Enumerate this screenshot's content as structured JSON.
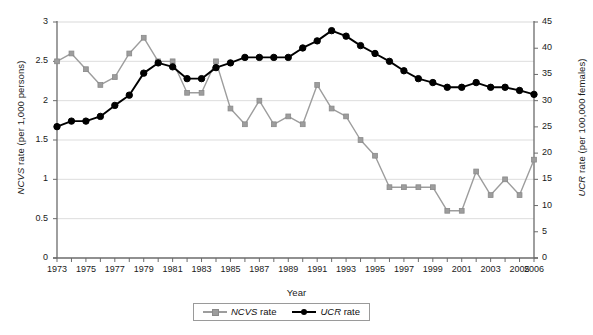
{
  "chart_data": {
    "type": "line",
    "title": "",
    "xlabel": "Year",
    "ylabel_left": "NCVS rate (per 1,000 persons)",
    "ylabel_left_italic_part": "NCVS",
    "ylabel_left_rest": " rate (per 1,000 persons)",
    "ylabel_right": "UCR rate (per 100,000 females)",
    "ylabel_right_italic_part": "UCR",
    "ylabel_right_rest": " rate (per 100,000 females)",
    "grid": true,
    "legend_position": "bottom",
    "ylim_left": [
      0,
      3
    ],
    "ylim_right": [
      0,
      45
    ],
    "yticks_left": [
      "0",
      "0.5",
      "1",
      "1.5",
      "2",
      "2.5",
      "3"
    ],
    "yticks_left_values": [
      0,
      0.5,
      1,
      1.5,
      2,
      2.5,
      3
    ],
    "yticks_right": [
      "0",
      "5",
      "10",
      "15",
      "20",
      "25",
      "30",
      "35",
      "40",
      "45"
    ],
    "yticks_right_values": [
      0,
      5,
      10,
      15,
      20,
      25,
      30,
      35,
      40,
      45
    ],
    "x": [
      1973,
      1974,
      1975,
      1976,
      1977,
      1978,
      1979,
      1980,
      1981,
      1982,
      1983,
      1984,
      1985,
      1986,
      1987,
      1988,
      1989,
      1990,
      1991,
      1992,
      1993,
      1994,
      1995,
      1996,
      1997,
      1998,
      1999,
      2000,
      2001,
      2002,
      2003,
      2004,
      2005,
      2006
    ],
    "xtick_labels": [
      "1973",
      "1975",
      "1977",
      "1979",
      "1981",
      "1983",
      "1985",
      "1987",
      "1989",
      "1991",
      "1993",
      "1995",
      "1997",
      "1999",
      "2001",
      "2003",
      "2005",
      "2006"
    ],
    "xtick_values": [
      1973,
      1975,
      1977,
      1979,
      1981,
      1983,
      1985,
      1987,
      1989,
      1991,
      1993,
      1995,
      1997,
      1999,
      2001,
      2003,
      2005,
      2006
    ],
    "series": [
      {
        "name": "NCVS rate",
        "axis": "left",
        "color": "#9d9d9d",
        "marker": "square",
        "values": [
          2.5,
          2.6,
          2.4,
          2.2,
          2.3,
          2.6,
          2.8,
          2.5,
          2.5,
          2.1,
          2.1,
          2.5,
          1.9,
          1.7,
          2.0,
          1.7,
          1.8,
          1.7,
          2.2,
          1.9,
          1.8,
          1.5,
          1.3,
          0.9,
          0.9,
          0.9,
          0.9,
          0.6,
          0.6,
          1.1,
          0.8,
          1.0,
          0.8,
          1.25
        ]
      },
      {
        "name": "UCR rate",
        "axis": "right",
        "color": "#000000",
        "marker": "circle",
        "values_left_scale": [
          1.67,
          1.74,
          1.74,
          1.8,
          1.94,
          2.07,
          2.35,
          2.48,
          2.43,
          2.28,
          2.28,
          2.42,
          2.48,
          2.55,
          2.55,
          2.55,
          2.55,
          2.67,
          2.76,
          2.89,
          2.82,
          2.7,
          2.6,
          2.5,
          2.38,
          2.28,
          2.23,
          2.17,
          2.17,
          2.23,
          2.17,
          2.17,
          2.13,
          2.08
        ],
        "values": [
          25.0,
          26.1,
          26.1,
          27.0,
          29.1,
          31.1,
          35.3,
          37.2,
          36.5,
          34.2,
          34.2,
          36.3,
          37.2,
          38.3,
          38.3,
          38.3,
          38.3,
          40.1,
          41.4,
          43.4,
          42.3,
          40.5,
          39.0,
          37.5,
          35.7,
          34.2,
          33.5,
          32.6,
          32.6,
          33.5,
          32.6,
          32.6,
          32.0,
          31.2
        ]
      }
    ]
  },
  "legend": {
    "items": [
      {
        "label": "NCVS rate",
        "italic": "NCVS",
        "rest": " rate"
      },
      {
        "label": "UCR rate",
        "italic": "UCR",
        "rest": " rate"
      }
    ]
  }
}
